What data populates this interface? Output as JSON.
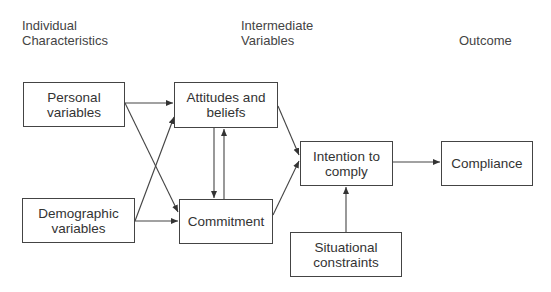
{
  "headers": {
    "individual": "Individual Characteristics",
    "intermediate": "Intermediate Variables",
    "outcome": "Outcome"
  },
  "nodes": {
    "personal": "Personal variables",
    "demographic": "Demographic variables",
    "attitudes": "Attitudes and beliefs",
    "commitment": "Commitment",
    "intention": "Intention to comply",
    "situational": "Situational constraints",
    "compliance": "Compliance"
  },
  "edges": [
    {
      "from": "personal",
      "to": "attitudes"
    },
    {
      "from": "personal",
      "to": "commitment"
    },
    {
      "from": "demographic",
      "to": "attitudes"
    },
    {
      "from": "demographic",
      "to": "commitment"
    },
    {
      "from": "attitudes",
      "to": "commitment"
    },
    {
      "from": "commitment",
      "to": "attitudes"
    },
    {
      "from": "attitudes",
      "to": "intention"
    },
    {
      "from": "commitment",
      "to": "intention"
    },
    {
      "from": "situational",
      "to": "intention"
    },
    {
      "from": "intention",
      "to": "compliance"
    }
  ]
}
